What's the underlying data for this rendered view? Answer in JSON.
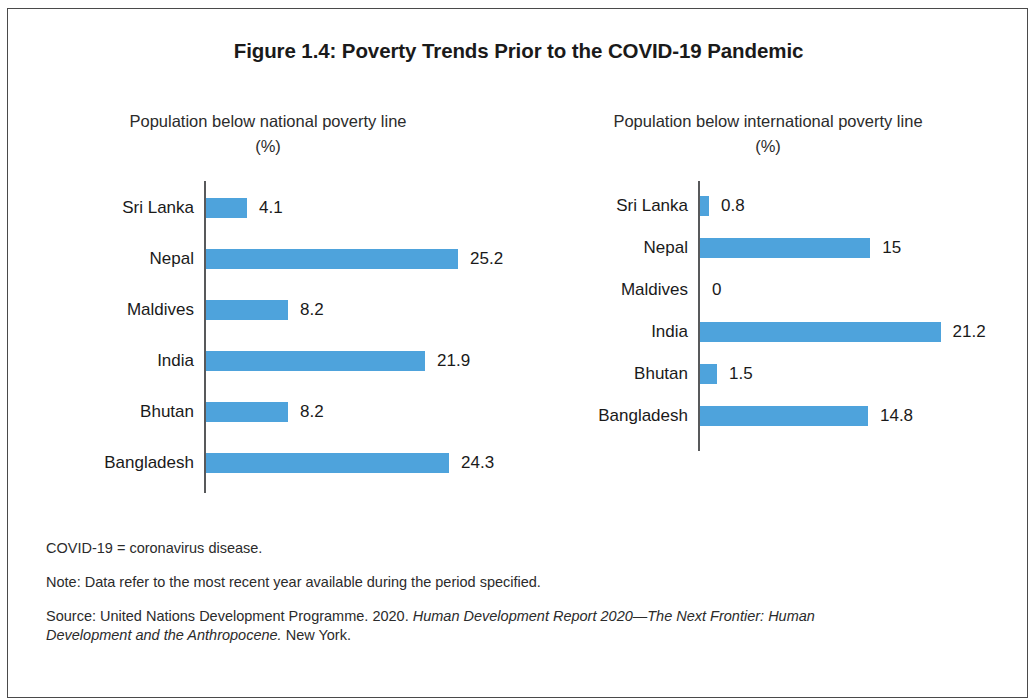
{
  "figure": {
    "title": "Figure 1.4: Poverty Trends Prior to the COVID-19 Pandemic"
  },
  "panels": {
    "national": {
      "subtitle": "Population below national poverty line\n(%)"
    },
    "international": {
      "subtitle": "Population below international poverty line\n(%)"
    }
  },
  "footnotes": {
    "abbreviation": "COVID-19 = coronavirus disease.",
    "note": "Note: Data refer to the most recent year available during the period specified.",
    "source_prefix": "Source: United Nations Development Programme. 2020. ",
    "source_italic": "Human Development Report 2020—The Next Frontier: Human Development and the Anthropocene.",
    "source_suffix": " New York."
  },
  "style": {
    "bar_color": "#4ea3dc",
    "axis_color": "#58595b",
    "text_color": "#1a1a1a",
    "frame_color": "#4a4a4a"
  },
  "chart_data": [
    {
      "type": "bar",
      "orientation": "horizontal",
      "title": "Population below national poverty line (%)",
      "xlabel": "%",
      "ylabel": "",
      "categories": [
        "Sri Lanka",
        "Nepal",
        "Maldives",
        "India",
        "Bhutan",
        "Bangladesh"
      ],
      "values": [
        4.1,
        25.2,
        8.2,
        21.9,
        8.2,
        24.3
      ],
      "value_labels": [
        "4.1",
        "25.2",
        "8.2",
        "21.9",
        "8.2",
        "24.3"
      ],
      "xlim": [
        0,
        25.2
      ],
      "grid": false,
      "legend": false
    },
    {
      "type": "bar",
      "orientation": "horizontal",
      "title": "Population below international poverty line (%)",
      "xlabel": "%",
      "ylabel": "",
      "categories": [
        "Sri Lanka",
        "Nepal",
        "Maldives",
        "India",
        "Bhutan",
        "Bangladesh"
      ],
      "values": [
        0.8,
        15,
        0,
        21.2,
        1.5,
        14.8
      ],
      "value_labels": [
        "0.8",
        "15",
        "0",
        "21.2",
        "1.5",
        "14.8"
      ],
      "xlim": [
        0,
        21.2
      ],
      "grid": false,
      "legend": false
    }
  ]
}
